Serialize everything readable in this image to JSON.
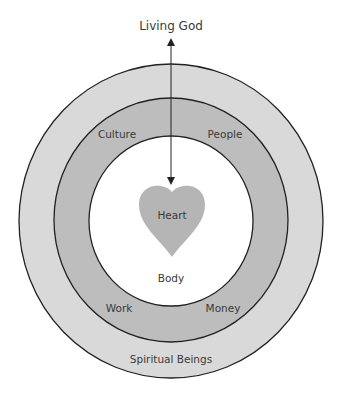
{
  "diagram": {
    "top_label": "Living God",
    "rings": {
      "outer": {
        "label": "Spiritual Beings",
        "color": "#d9d9d9"
      },
      "middle": {
        "labels": [
          "Culture",
          "People",
          "Work",
          "Money"
        ],
        "color": "#bdbdbd"
      },
      "inner": {
        "label": "Body",
        "color": "#ffffff"
      }
    },
    "center": {
      "label": "Heart",
      "color": "#b5b5b5"
    },
    "arrow": {
      "direction": "bidirectional",
      "from": "Living God",
      "to": "Heart"
    }
  }
}
